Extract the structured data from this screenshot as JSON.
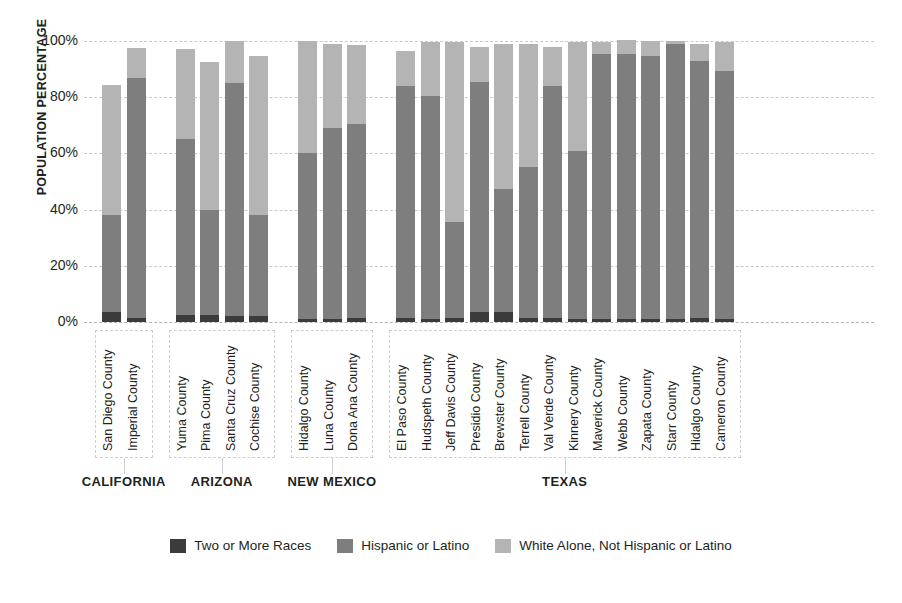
{
  "chart_data": {
    "type": "bar",
    "stacked": true,
    "title": "",
    "xlabel": "",
    "ylabel": "POPULATION PERCENTAGE",
    "ylim": [
      0,
      100
    ],
    "yticks": [
      "0%",
      "20%",
      "40%",
      "60%",
      "80%",
      "100%"
    ],
    "ytick_values": [
      0,
      20,
      40,
      60,
      80,
      100
    ],
    "grid": true,
    "legend_position": "bottom",
    "series": [
      {
        "name": "Two or More Races",
        "color": "#3b3b3b"
      },
      {
        "name": "Hispanic or Latino",
        "color": "#7e7e7e"
      },
      {
        "name": "White Alone, Not Hispanic or Latino",
        "color": "#b4b4b4"
      }
    ],
    "groups": [
      {
        "state": "CALIFORNIA",
        "categories": [
          "San Diego County",
          "Imperial County"
        ],
        "values": {
          "Two or More Races": [
            3.5,
            1.5
          ],
          "Hispanic or Latino": [
            34.5,
            85.5
          ],
          "White Alone, Not Hispanic or Latino": [
            46.5,
            10.5
          ]
        },
        "totals": [
          84.5,
          97.5
        ]
      },
      {
        "state": "ARIZONA",
        "categories": [
          "Yuma County",
          "Pima County",
          "Santa Cruz County",
          "Cochise County"
        ],
        "values": {
          "Two or More Races": [
            2.5,
            2.5,
            2.0,
            2.0
          ],
          "Hispanic or Latino": [
            62.5,
            37.5,
            83.0,
            36.0
          ],
          "White Alone, Not Hispanic or Latino": [
            32.0,
            52.5,
            15.0,
            56.5
          ]
        },
        "totals": [
          97.0,
          92.5,
          100.0,
          94.5
        ]
      },
      {
        "state": "NEW MEXICO",
        "categories": [
          "Hidalgo County",
          "Luna County",
          "Dona Ana County"
        ],
        "values": {
          "Two or More Races": [
            1.0,
            1.0,
            1.5
          ],
          "Hispanic or Latino": [
            59.0,
            68.0,
            69.0
          ],
          "White Alone, Not Hispanic or Latino": [
            40.0,
            30.0,
            28.0
          ]
        },
        "totals": [
          100.0,
          99.0,
          98.5
        ]
      },
      {
        "state": "TEXAS",
        "categories": [
          "El Paso County",
          "Hudspeth County",
          "Jeff Davis County",
          "Presidio County",
          "Brewster County",
          "Terrell County",
          "Val Verde County",
          "Kinnery County",
          "Maverick County",
          "Webb County",
          "Zapata County",
          "Starr County",
          "Hidalgo County",
          "Cameron County"
        ],
        "values": {
          "Two or More Races": [
            1.5,
            1.0,
            1.5,
            3.5,
            3.5,
            1.5,
            1.5,
            1.0,
            1.0,
            1.0,
            1.0,
            1.0,
            1.5,
            1.0
          ],
          "Hispanic or Latino": [
            82.5,
            79.5,
            34.0,
            82.0,
            44.0,
            53.5,
            82.5,
            60.0,
            94.5,
            94.5,
            93.5,
            98.0,
            91.5,
            88.5
          ],
          "White Alone, Not Hispanic or Latino": [
            12.5,
            19.0,
            64.0,
            12.5,
            51.5,
            44.0,
            14.0,
            38.5,
            4.0,
            5.0,
            5.5,
            1.0,
            6.0,
            10.0
          ]
        },
        "totals": [
          96.5,
          99.5,
          99.5,
          98.0,
          99.0,
          99.0,
          98.0,
          99.5,
          99.5,
          100.5,
          100.0,
          100.0,
          99.0,
          99.5
        ]
      }
    ]
  },
  "axis": {
    "y_title": "POPULATION PERCENTAGE",
    "ticks": {
      "t100": "100%",
      "t80": "80%",
      "t60": "60%",
      "t40": "40%",
      "t20": "20%",
      "t0": "0%"
    }
  },
  "states": {
    "california": "CALIFORNIA",
    "arizona": "ARIZONA",
    "new_mexico": "NEW MEXICO",
    "texas": "TEXAS"
  },
  "counties": {
    "ca": [
      "San Diego County",
      "Imperial County"
    ],
    "az": [
      "Yuma County",
      "Pima County",
      "Santa Cruz County",
      "Cochise County"
    ],
    "nm": [
      "Hidalgo County",
      "Luna County",
      "Dona Ana County"
    ],
    "tx": [
      "El Paso County",
      "Hudspeth County",
      "Jeff Davis County",
      "Presidio County",
      "Brewster County",
      "Terrell County",
      "Val Verde County",
      "Kinnery County",
      "Maverick County",
      "Webb County",
      "Zapata County",
      "Starr County",
      "Hidalgo County",
      "Cameron County"
    ]
  },
  "legend": {
    "items": [
      {
        "label": "Two or More Races",
        "color": "#3b3b3b"
      },
      {
        "label": "Hispanic or Latino",
        "color": "#7e7e7e"
      },
      {
        "label": "White Alone, Not Hispanic or Latino",
        "color": "#b4b4b4"
      }
    ]
  }
}
